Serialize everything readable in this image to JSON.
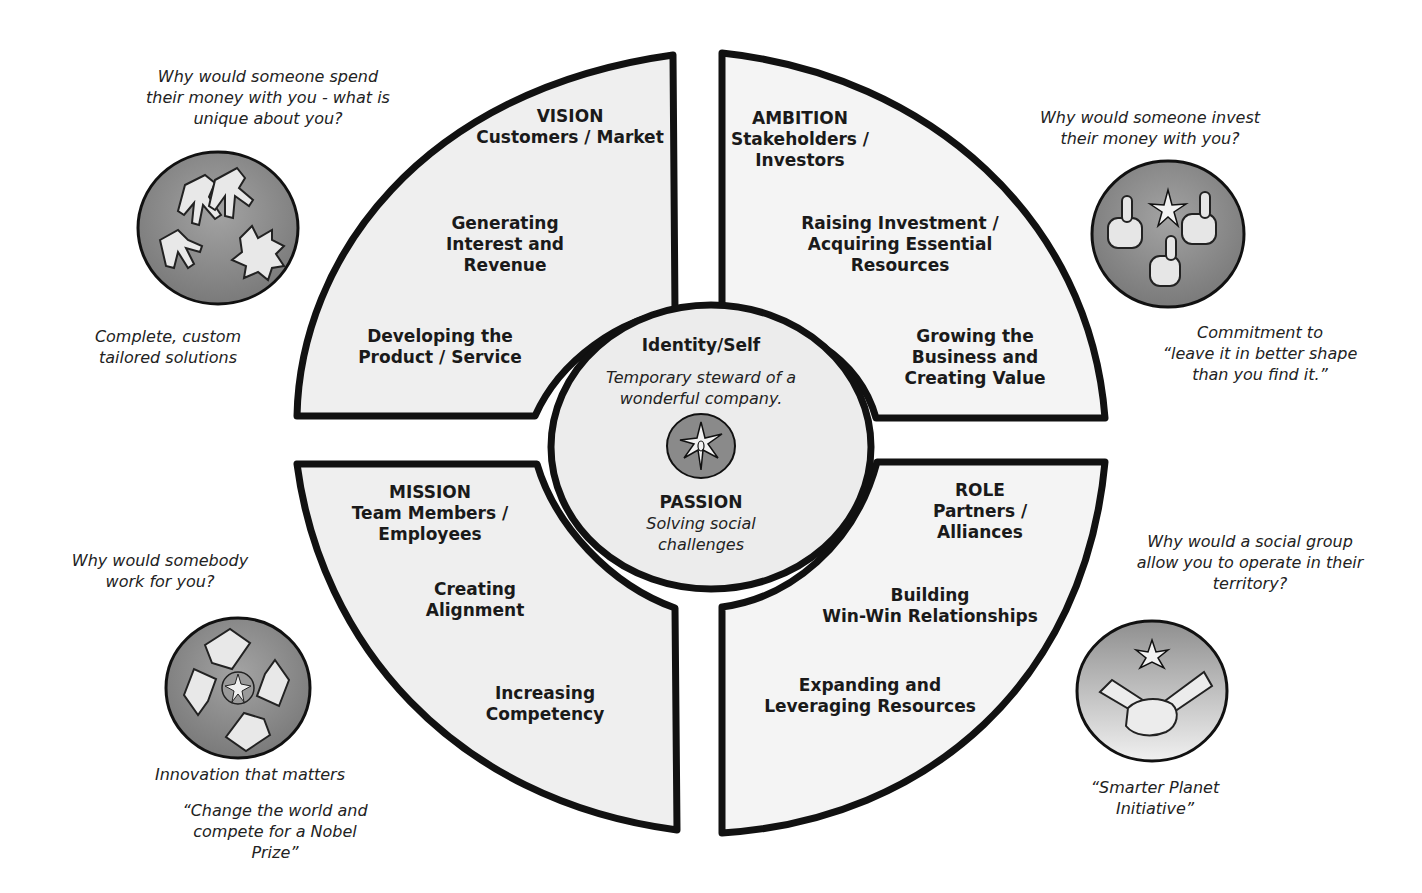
{
  "colors": {
    "quadrant_fill": "#efefef",
    "outline": "#111111",
    "icon_fill": "#8a8a8a",
    "icon_fill_light": "#cfcfcf",
    "background": "#ffffff"
  },
  "center": {
    "title": "Identity/Self",
    "subtitle_lines": [
      "Temporary steward of a",
      "wonderful company."
    ],
    "icon": "star-compass-icon",
    "passion_title": "PASSION",
    "passion_lines": [
      "Solving social",
      "challenges"
    ]
  },
  "quadrants": {
    "vision": {
      "header_lines": [
        "VISION",
        "Customers / Market"
      ],
      "item1_lines": [
        "Generating",
        "Interest and",
        "Revenue"
      ],
      "item2_lines": [
        "Developing the",
        "Product / Service"
      ]
    },
    "ambition": {
      "header_lines": [
        "AMBITION",
        "Stakeholders /",
        "Investors"
      ],
      "item1_lines": [
        "Raising Investment /",
        "Acquiring Essential",
        "Resources"
      ],
      "item2_lines": [
        "Growing the",
        "Business and",
        "Creating Value"
      ]
    },
    "mission": {
      "header_lines": [
        "MISSION",
        "Team Members /",
        "Employees"
      ],
      "item1_lines": [
        "Creating",
        "Alignment"
      ],
      "item2_lines": [
        "Increasing",
        "Competency"
      ]
    },
    "role": {
      "header_lines": [
        "ROLE",
        "Partners /",
        "Alliances"
      ],
      "item1_lines": [
        "Building",
        "Win-Win Relationships"
      ],
      "item2_lines": [
        "Expanding and",
        "Leveraging Resources"
      ]
    }
  },
  "callouts": {
    "top_left": {
      "question_lines": [
        "Why would someone spend",
        "their money with you - what is",
        "unique about you?"
      ],
      "icon": "reaching-hands-icon",
      "answer_lines": [
        "Complete, custom",
        "tailored solutions"
      ]
    },
    "top_right": {
      "question_lines": [
        "Why would someone invest",
        "their money with you?"
      ],
      "icon": "thumbs-up-icon",
      "answer_lines": [
        "Commitment to",
        "“leave it in better shape",
        "than you find it.”"
      ]
    },
    "bottom_left": {
      "question_lines": [
        "Why would somebody",
        "work for you?"
      ],
      "icon": "linked-hands-icon",
      "answer_lines": [
        "Innovation that matters"
      ],
      "quote_lines": [
        "“Change the world and",
        "compete for a Nobel",
        "Prize”"
      ]
    },
    "bottom_right": {
      "question_lines": [
        "Why would a social group",
        "allow you to operate in their",
        "territory?"
      ],
      "icon": "handshake-icon",
      "answer_lines": [
        "“Smarter Planet",
        "Initiative”"
      ]
    }
  }
}
